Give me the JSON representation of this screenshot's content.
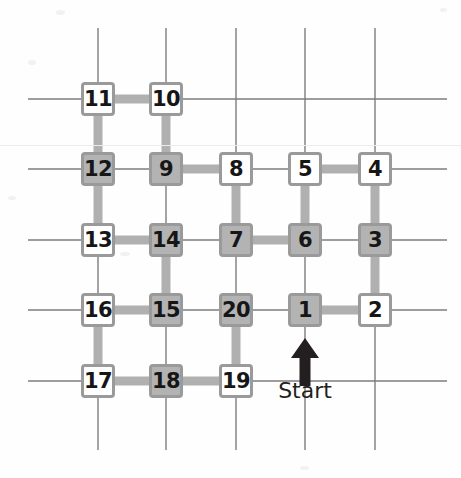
{
  "figure": {
    "type": "grid-path-diagram",
    "start_label": "Start",
    "arrow_icon": "up-arrow-icon",
    "grid": {
      "columns_x": [
        98,
        166,
        236,
        305,
        375
      ],
      "rows_y": [
        99,
        169,
        240,
        310,
        381
      ],
      "line_extent_x": [
        28,
        447
      ],
      "line_extent_y": [
        28,
        450
      ],
      "grid_line_color": "#7d7d7d",
      "path_color": "#b0b0b0",
      "node_border_color": "#9a9a9a",
      "node_fill_shaded": "#b3b3b3",
      "node_fill_white": "#ffffff",
      "text_color": "#161616"
    },
    "nodes": [
      {
        "label": "11",
        "col": 0,
        "row": 0,
        "fill": "white"
      },
      {
        "label": "10",
        "col": 1,
        "row": 0,
        "fill": "white"
      },
      {
        "label": "12",
        "col": 0,
        "row": 1,
        "fill": "shaded"
      },
      {
        "label": "9",
        "col": 1,
        "row": 1,
        "fill": "shaded"
      },
      {
        "label": "8",
        "col": 2,
        "row": 1,
        "fill": "white"
      },
      {
        "label": "5",
        "col": 3,
        "row": 1,
        "fill": "white"
      },
      {
        "label": "4",
        "col": 4,
        "row": 1,
        "fill": "white"
      },
      {
        "label": "13",
        "col": 0,
        "row": 2,
        "fill": "white"
      },
      {
        "label": "14",
        "col": 1,
        "row": 2,
        "fill": "shaded"
      },
      {
        "label": "7",
        "col": 2,
        "row": 2,
        "fill": "shaded"
      },
      {
        "label": "6",
        "col": 3,
        "row": 2,
        "fill": "shaded"
      },
      {
        "label": "3",
        "col": 4,
        "row": 2,
        "fill": "shaded"
      },
      {
        "label": "16",
        "col": 0,
        "row": 3,
        "fill": "white"
      },
      {
        "label": "15",
        "col": 1,
        "row": 3,
        "fill": "shaded"
      },
      {
        "label": "20",
        "col": 2,
        "row": 3,
        "fill": "shaded"
      },
      {
        "label": "1",
        "col": 3,
        "row": 3,
        "fill": "shaded"
      },
      {
        "label": "2",
        "col": 4,
        "row": 3,
        "fill": "white"
      },
      {
        "label": "17",
        "col": 0,
        "row": 4,
        "fill": "white"
      },
      {
        "label": "18",
        "col": 1,
        "row": 4,
        "fill": "shaded"
      },
      {
        "label": "19",
        "col": 2,
        "row": 4,
        "fill": "white"
      }
    ],
    "path_sequence": [
      "1",
      "2",
      "3",
      "4",
      "5",
      "6",
      "7",
      "8",
      "9",
      "10",
      "11",
      "12",
      "13",
      "14",
      "15",
      "16",
      "17",
      "18",
      "19",
      "20"
    ],
    "path_edges": [
      {
        "from": "1",
        "to": "2"
      },
      {
        "from": "2",
        "to": "3"
      },
      {
        "from": "3",
        "to": "4"
      },
      {
        "from": "4",
        "to": "5"
      },
      {
        "from": "5",
        "to": "6"
      },
      {
        "from": "6",
        "to": "7"
      },
      {
        "from": "7",
        "to": "8"
      },
      {
        "from": "8",
        "to": "9"
      },
      {
        "from": "9",
        "to": "10"
      },
      {
        "from": "10",
        "to": "11"
      },
      {
        "from": "11",
        "to": "12"
      },
      {
        "from": "12",
        "to": "13"
      },
      {
        "from": "13",
        "to": "14"
      },
      {
        "from": "14",
        "to": "15"
      },
      {
        "from": "15",
        "to": "16"
      },
      {
        "from": "16",
        "to": "17"
      },
      {
        "from": "17",
        "to": "18"
      },
      {
        "from": "18",
        "to": "19"
      },
      {
        "from": "19",
        "to": "20"
      }
    ],
    "arrow": {
      "x": 305,
      "tip_y": 338,
      "tail_y": 386
    },
    "start_text_pos": {
      "x": 305,
      "y": 378
    },
    "scanline_y": 145
  }
}
